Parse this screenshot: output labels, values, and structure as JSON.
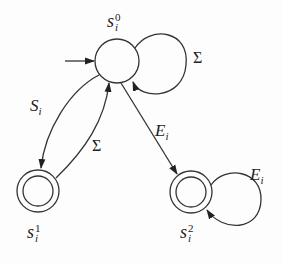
{
  "diagram": {
    "type": "finite-automaton",
    "states": [
      {
        "id": "s0",
        "base": "s",
        "sub": "i",
        "sup": "0",
        "initial": true,
        "accepting": false
      },
      {
        "id": "s1",
        "base": "s",
        "sub": "i",
        "sup": "1",
        "initial": false,
        "accepting": true
      },
      {
        "id": "s2",
        "base": "s",
        "sub": "i",
        "sup": "2",
        "initial": false,
        "accepting": true
      }
    ],
    "transitions": [
      {
        "from": "s0",
        "to": "s0",
        "label": "Σ"
      },
      {
        "from": "s0",
        "to": "s1",
        "label_base": "S",
        "label_sub": "i"
      },
      {
        "from": "s1",
        "to": "s0",
        "label": "Σ"
      },
      {
        "from": "s0",
        "to": "s2",
        "label_base": "E",
        "label_sub": "i"
      },
      {
        "from": "s2",
        "to": "s2",
        "label_base": "E",
        "label_sub": "i"
      }
    ],
    "labels": {
      "sigma_loop": "Σ",
      "s_i_base": "S",
      "s_i_sub": "i",
      "sigma_back": "Σ",
      "e_i_base": "E",
      "e_i_sub": "i",
      "e_i_loop_base": "E",
      "e_i_loop_sub": "i"
    },
    "colors": {
      "stroke": "#333333",
      "background": "#fdfdfd"
    }
  }
}
